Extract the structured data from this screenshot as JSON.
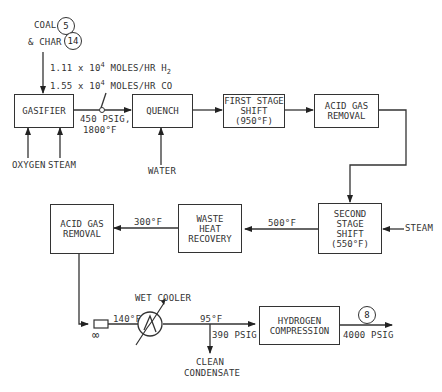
{
  "diagram": {
    "type": "process-flow",
    "inputs": {
      "coal_label": "COAL",
      "coal_stream": "5",
      "char_label": "& CHAR",
      "char_stream": "14",
      "oxygen": "OXYGEN",
      "steam_gasifier": "STEAM",
      "water": "WATER",
      "steam_shift": "STEAM"
    },
    "flow_note": {
      "line1_coef": "1.11 x 10",
      "line1_exp": "4",
      "line1_unit": " MOLES/HR H",
      "line1_sub": "2",
      "line2_coef": "1.55 x 10",
      "line2_exp": "4",
      "line2_unit": " MOLES/HR CO"
    },
    "boxes": {
      "gasifier": "GASIFIER",
      "quench": "QUENCH",
      "first_shift": "FIRST STAGE\nSHIFT\n(950°F)",
      "acid_gas_1": "ACID GAS\nREMOVAL",
      "second_shift": "SECOND\nSTAGE\nSHIFT\n(550°F)",
      "waste_heat": "WASTE\nHEAT\nRECOVERY",
      "acid_gas_2": "ACID GAS\nREMOVAL",
      "h2_compression": "HYDROGEN\nCOMPRESSION"
    },
    "conditions": {
      "gasifier_out_p": "450 PSIG,",
      "gasifier_out_t": "1800°F",
      "shift2_out_t": "500°F",
      "whr_out_t": "300°F",
      "pre_cooler_t": "140°F",
      "post_cooler_t": "95°F",
      "post_cooler_p": "390 PSIG",
      "final_p": "4000 PSIG"
    },
    "equipment": {
      "wet_cooler": "WET COOLER",
      "condensate": "CLEAN\nCONDENSATE"
    },
    "outputs": {
      "product_stream": "8"
    }
  }
}
